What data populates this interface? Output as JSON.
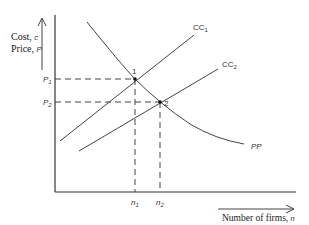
{
  "diagram": {
    "y_axis_label_line1": "Cost, c",
    "y_axis_label_line1_main": "Cost,",
    "y_axis_label_line1_var": "c",
    "y_axis_label_line2_main": "Price,",
    "y_axis_label_line2_var": "P",
    "x_axis_label_main": "Number of firms,",
    "x_axis_label_var": "n",
    "curves": {
      "cc1": {
        "name": "CC",
        "sub": "1"
      },
      "cc2": {
        "name": "CC",
        "sub": "2"
      },
      "pp": {
        "name": "PP"
      }
    },
    "points": {
      "p1": {
        "label": "1"
      },
      "p2": {
        "label": "2"
      }
    },
    "y_ticks": {
      "p1": {
        "name": "P",
        "sub": "1"
      },
      "p2": {
        "name": "P",
        "sub": "2"
      }
    },
    "x_ticks": {
      "n1": {
        "name": "n",
        "sub": "1"
      },
      "n2": {
        "name": "n",
        "sub": "2"
      }
    }
  }
}
